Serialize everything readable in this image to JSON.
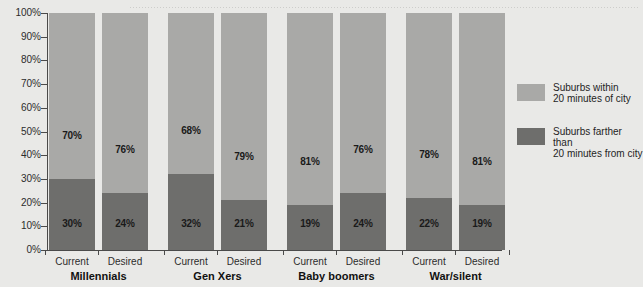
{
  "chart_data": {
    "type": "bar",
    "stacked": true,
    "title": "",
    "subtitle": "",
    "xlabel": "",
    "ylabel": "",
    "ylim": [
      0,
      100
    ],
    "grid": false,
    "legend_position": "right",
    "y_ticks": [
      "0%",
      "10%",
      "20%",
      "30%",
      "40%",
      "50%",
      "60%",
      "70%",
      "80%",
      "90%",
      "100%"
    ],
    "groups": [
      "Millennials",
      "Gen Xers",
      "Baby boomers",
      "War/silent"
    ],
    "categories": [
      "Millennials Current",
      "Millennials Desired",
      "Gen Xers Current",
      "Gen Xers Desired",
      "Baby boomers Current",
      "Baby boomers Desired",
      "War/silent Current",
      "War/silent Desired"
    ],
    "sub_categories": [
      "Current",
      "Desired"
    ],
    "series": [
      {
        "name": "Suburbs within 20 minutes of city",
        "color": "#a9a9a7",
        "values": [
          70,
          76,
          68,
          79,
          81,
          76,
          78,
          81
        ],
        "labels": [
          "70%",
          "76%",
          "68%",
          "79%",
          "81%",
          "76%",
          "78%",
          "81%"
        ]
      },
      {
        "name": "Suburbs farther than 20 minutes from city",
        "color": "#6e6e6c",
        "values": [
          30,
          24,
          32,
          21,
          19,
          24,
          22,
          19
        ],
        "labels": [
          "30%",
          "24%",
          "32%",
          "21%",
          "19%",
          "24%",
          "22%",
          "19%"
        ]
      }
    ]
  },
  "legend": {
    "items": [
      {
        "label": "Suburbs within\n20 minutes of city",
        "swatch": "light"
      },
      {
        "label": "Suburbs farther than\n20 minutes from city",
        "swatch": "dark"
      }
    ]
  },
  "colors": {
    "background": "#e9e9e7",
    "series_light": "#a9a9a7",
    "series_dark": "#6e6e6c",
    "axis": "#4a4a4a",
    "text": "#1f1f1f"
  }
}
